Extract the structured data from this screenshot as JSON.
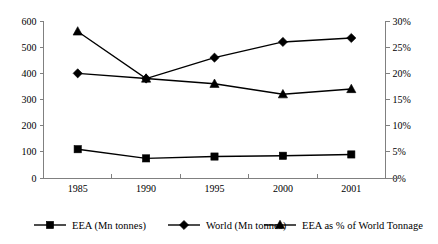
{
  "chart_data": {
    "type": "line",
    "title": "",
    "xlabel": "",
    "ylabel": "",
    "categories": [
      "1985",
      "1990",
      "1995",
      "2000",
      "2001"
    ],
    "grid": false,
    "legend_position": "bottom",
    "axes": {
      "left": {
        "label": "",
        "min": 0,
        "max": 600,
        "step": 100,
        "ticks": [
          "0",
          "100",
          "200",
          "300",
          "400",
          "500",
          "600"
        ],
        "unit": "Mn tonnes"
      },
      "right": {
        "label": "",
        "min": 0,
        "max": 30,
        "step": 5,
        "ticks": [
          "0%",
          "5%",
          "10%",
          "15%",
          "20%",
          "25%",
          "30%"
        ],
        "unit": "%"
      }
    },
    "series": [
      {
        "name": "EEA (Mn tonnes)",
        "marker": "square",
        "axis": "left",
        "values": [
          110,
          75,
          82,
          85,
          90
        ]
      },
      {
        "name": "World (Mn tonnes)",
        "marker": "diamond",
        "axis": "left",
        "values": [
          400,
          380,
          460,
          520,
          535
        ]
      },
      {
        "name": "EEA as % of World Tonnage",
        "marker": "triangle",
        "axis": "right",
        "values": [
          28,
          19,
          18,
          16,
          17
        ]
      }
    ]
  },
  "legend": {
    "items": [
      {
        "label": "EEA (Mn tonnes)",
        "marker": "square"
      },
      {
        "label": "World (Mn tonnes)",
        "marker": "diamond"
      },
      {
        "label": "EEA as % of World Tonnage",
        "marker": "triangle"
      }
    ]
  },
  "colors": {
    "series": "#000000",
    "axis": "#808080",
    "background": "#ffffff"
  }
}
